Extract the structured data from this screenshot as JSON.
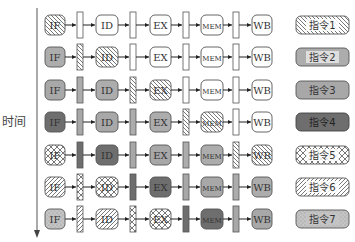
{
  "axis": {
    "label": "时间"
  },
  "stages": [
    "IF",
    "ID",
    "EX",
    "MEM",
    "WB"
  ],
  "instructions": [
    {
      "id": 1,
      "label": "指令1",
      "pattern": "diag-back",
      "fill": "#ffffff",
      "stroke": "#555555"
    },
    {
      "id": 2,
      "label": "指令2",
      "pattern": "vertical",
      "fill": "#e6e6e6",
      "stroke": "#555555"
    },
    {
      "id": 3,
      "label": "指令3",
      "pattern": "solid",
      "fill": "#a8a8a8",
      "stroke": "#555555"
    },
    {
      "id": 4,
      "label": "指令4",
      "pattern": "solid",
      "fill": "#6e6e6e",
      "stroke": "#444444"
    },
    {
      "id": 5,
      "label": "指令5",
      "pattern": "cross",
      "fill": "#ffffff",
      "stroke": "#555555"
    },
    {
      "id": 6,
      "label": "指令6",
      "pattern": "diag-fwd",
      "fill": "#ffffff",
      "stroke": "#555555"
    },
    {
      "id": 7,
      "label": "指令7",
      "pattern": "dots",
      "fill": "#c4c4c4",
      "stroke": "#555555"
    }
  ],
  "rows": [
    {
      "time": 1,
      "IF": 1,
      "R1": 0,
      "ID": 0,
      "R2": 0,
      "EX": 0,
      "R3": 0,
      "MEM": 0,
      "R4": 0,
      "WB": 0
    },
    {
      "time": 2,
      "IF": 2,
      "R1": 1,
      "ID": 1,
      "R2": 0,
      "EX": 0,
      "R3": 0,
      "MEM": 0,
      "R4": 0,
      "WB": 0
    },
    {
      "time": 3,
      "IF": 3,
      "R1": 2,
      "ID": 2,
      "R2": 1,
      "EX": 1,
      "R3": 0,
      "MEM": 0,
      "R4": 0,
      "WB": 0
    },
    {
      "time": 4,
      "IF": 4,
      "R1": 3,
      "ID": 3,
      "R2": 2,
      "EX": 2,
      "R3": 1,
      "MEM": 1,
      "R4": 0,
      "WB": 0
    },
    {
      "time": 5,
      "IF": 5,
      "R1": 4,
      "ID": 4,
      "R2": 3,
      "EX": 3,
      "R3": 2,
      "MEM": 2,
      "R4": 1,
      "WB": 1
    },
    {
      "time": 6,
      "IF": 6,
      "R1": 5,
      "ID": 5,
      "R2": 4,
      "EX": 4,
      "R3": 3,
      "MEM": 3,
      "R4": 2,
      "WB": 2
    },
    {
      "time": 7,
      "IF": 7,
      "R1": 6,
      "ID": 6,
      "R2": 5,
      "EX": 5,
      "R3": 4,
      "MEM": 4,
      "R4": 3,
      "WB": 3
    }
  ],
  "layout": {
    "row_y": [
      25,
      57,
      90,
      122,
      155,
      187,
      219
    ],
    "stage_x": {
      "IF": [
        45,
        20
      ],
      "ID": [
        96,
        22
      ],
      "EX": [
        150,
        21
      ],
      "MEM": [
        201,
        22
      ],
      "WB": [
        252,
        20
      ]
    },
    "reg_x": {
      "R1": 77,
      "R2": 130,
      "R3": 183,
      "R4": 233
    },
    "legend_x": 296,
    "legend_w": 53
  }
}
